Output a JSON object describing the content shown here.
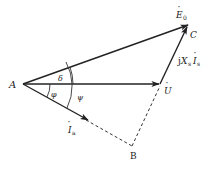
{
  "diagram": {
    "type": "phasor-diagram",
    "points": {
      "A": {
        "label": "A",
        "x": 23,
        "y": 84
      },
      "C": {
        "label": "C",
        "x": 188,
        "y": 25
      },
      "U_tip": {
        "x": 160,
        "y": 84
      },
      "B": {
        "label": "B",
        "x": 132,
        "y": 146
      }
    },
    "vectors": [
      {
        "name": "E0",
        "label": "Ė₀",
        "from": "A",
        "to": "C",
        "style": "solid-arrow"
      },
      {
        "name": "U",
        "label": "U̇",
        "from": "A",
        "to": "U_tip",
        "style": "solid-arrow"
      },
      {
        "name": "Ia",
        "label": "İₐ",
        "from": "A",
        "to": "Ia_tip",
        "style": "solid-arrow"
      },
      {
        "name": "jXsIa",
        "label": "jXₛİₐ",
        "from": "U_tip",
        "to": "C",
        "style": "solid-arrow"
      }
    ],
    "dashed_lines": [
      {
        "from": "Ia_tip",
        "to": "B"
      },
      {
        "from": "B",
        "to": "U_tip"
      }
    ],
    "angles": [
      {
        "name": "delta",
        "label": "δ",
        "between": [
          "U",
          "E0"
        ]
      },
      {
        "name": "phi",
        "label": "φ",
        "between": [
          "Ia",
          "U"
        ]
      },
      {
        "name": "psi",
        "label": "ψ",
        "between": [
          "Ia",
          "E0"
        ]
      }
    ],
    "labels": {
      "A": "A",
      "B": "B",
      "C": "C",
      "E0_main": "E",
      "E0_sub": "0",
      "U_main": "U",
      "Ia_main": "I",
      "Ia_sub": "a",
      "jX_j": "j",
      "jX_X": "X",
      "jX_s": "s",
      "jX_I": "I",
      "jX_a": "a",
      "delta": "δ",
      "phi": "φ",
      "psi": "ψ",
      "dot": "·"
    }
  }
}
